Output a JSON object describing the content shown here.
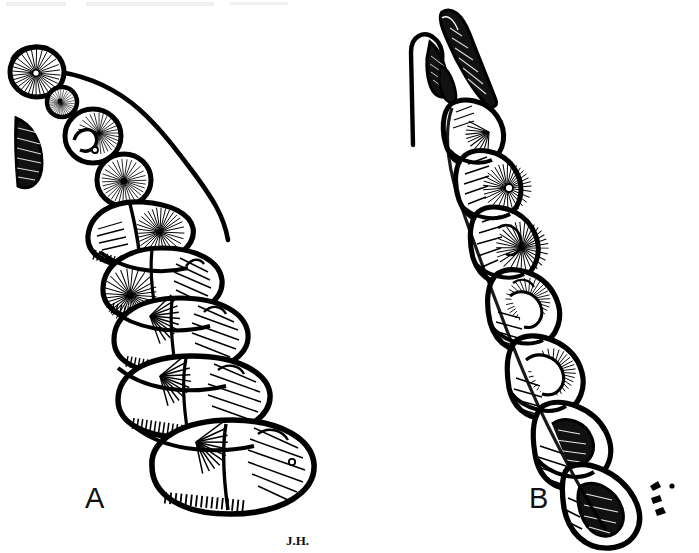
{
  "figure": {
    "medium": "black-and-white line engraving",
    "background_color": "#ffffff",
    "ink_color": "#000000",
    "width_px": 699,
    "height_px": 553,
    "panels": [
      {
        "id": "A",
        "label": "A",
        "label_x": 85,
        "label_y": 508,
        "description": "Diagonal chain of pod segments running from upper-left to lower-right, segments increasing in size downward, with a slender stem line along the upper-right margin and a detached dark crescent-shaped seed at left",
        "segment_count": 11,
        "has_stem_line": true,
        "has_detached_crescent": true
      },
      {
        "id": "B",
        "label": "B",
        "label_x": 529,
        "label_y": 508,
        "description": "Near-vertical chain of pod segments tilting to the lower-right, topped by two pointed beak-like valves and a thin straight peduncle at the upper-left",
        "segment_count": 9,
        "has_stem_line": true,
        "has_pointed_tip": true
      }
    ],
    "signature": {
      "text": "J.H.",
      "x": 291,
      "y": 544,
      "description": "engraver monogram beneath panel A"
    },
    "artifacts": {
      "top_left_smudge": "faint grey scan smudge along the upper-left edge"
    }
  }
}
